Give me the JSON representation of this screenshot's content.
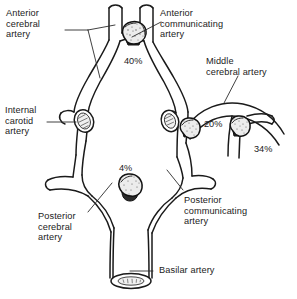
{
  "figure": {
    "type": "anatomical-diagram",
    "background_color": "#ffffff",
    "line_color": "#1a1a1a",
    "text_color": "#222222"
  },
  "labels": {
    "anterior_cerebral_artery": "Anterior\ncerebral\nartery",
    "anterior_communicating_artery": "Anterior\ncommunicating\nartery",
    "middle_cerebral_artery": "Middle\ncerebral artery",
    "internal_carotid_artery": "Internal\ncarotid\nartery",
    "posterior_cerebral_artery": "Posterior\ncerebral\nartery",
    "posterior_communicating_artery": "Posterior\ncommunicating\nartery",
    "basilar_artery": "Basilar artery"
  },
  "aneurysms": [
    {
      "site": "anterior-communicating-artery",
      "percent": "40%"
    },
    {
      "site": "internal-carotid-posterior-communicating",
      "percent": "20%"
    },
    {
      "site": "middle-cerebral-artery-bifurcation",
      "percent": "34%"
    },
    {
      "site": "basilar-tip",
      "percent": "4%"
    }
  ]
}
